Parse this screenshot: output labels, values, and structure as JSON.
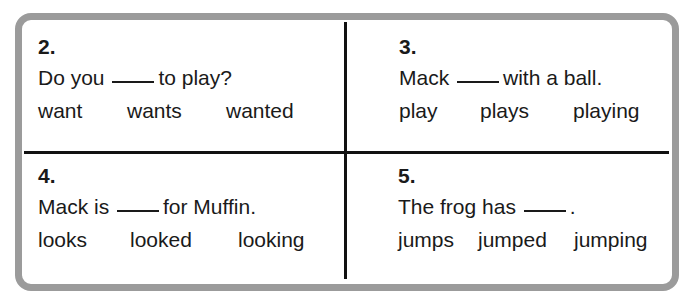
{
  "worksheet": {
    "questions": [
      {
        "number": "2.",
        "sentence_before": "Do you",
        "sentence_after": "to play?",
        "choices": [
          "want",
          "wants",
          "wanted"
        ]
      },
      {
        "number": "3.",
        "sentence_before": "Mack",
        "sentence_after": "with a ball.",
        "choices": [
          "play",
          "plays",
          "playing"
        ]
      },
      {
        "number": "4.",
        "sentence_before": "Mack is",
        "sentence_after": "for Muffin.",
        "choices": [
          "looks",
          "looked",
          "looking"
        ]
      },
      {
        "number": "5.",
        "sentence_before": "The frog has",
        "sentence_after": ".",
        "choices": [
          "jumps",
          "jumped",
          "jumping"
        ]
      }
    ],
    "colors": {
      "frame_border": "#9b9b9b",
      "divider": "#111111",
      "text": "#1a1a1a"
    }
  }
}
